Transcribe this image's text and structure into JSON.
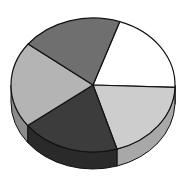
{
  "chart_data": {
    "type": "pie",
    "style": "3d",
    "title": "",
    "legend": "none",
    "labels_visible": false,
    "categories": [
      "Slice 1",
      "Slice 2",
      "Slice 3",
      "Slice 4",
      "Slice 5"
    ],
    "values": [
      20.3,
      19.7,
      19.4,
      20.8,
      19.8
    ],
    "start_angle_deg": -71,
    "direction": "clockwise",
    "colors": [
      "#ffffff",
      "#cdcdcd",
      "#3c3c3c",
      "#b4b4b4",
      "#6f6f6f"
    ],
    "side_colors": [
      "#e0e0e0",
      "#a8a8a8",
      "#2a2a2a",
      "#8c8c8c",
      "#505050"
    ]
  },
  "layout": {
    "cx": 93,
    "cy": 85,
    "rx": 82,
    "ry": 67,
    "depth": 17,
    "outline": "#111111"
  }
}
